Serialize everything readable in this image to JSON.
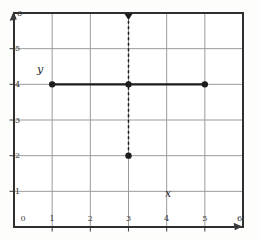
{
  "figure": {
    "background": "#fdfdfc",
    "plot_background": "#ffffff",
    "frame_color": "#2f2f2f",
    "grid_color": "#9b9b9b",
    "ink_color": "#1d1d1d",
    "tick_label_color": "#3a3a3a"
  },
  "chart_data": {
    "type": "scatter",
    "title": "",
    "xlabel": "x",
    "ylabel": "y",
    "xlim": [
      0,
      6
    ],
    "ylim": [
      0,
      6
    ],
    "grid": true,
    "x_ticks": [
      0,
      1,
      2,
      3,
      4,
      5,
      6
    ],
    "y_ticks": [
      1,
      2,
      3,
      4,
      5,
      6
    ],
    "points": [
      {
        "x": 1,
        "y": 4
      },
      {
        "x": 3,
        "y": 4
      },
      {
        "x": 5,
        "y": 4
      },
      {
        "x": 3,
        "y": 2
      }
    ],
    "segments": [
      {
        "style": "solid",
        "x1": 1,
        "y1": 4,
        "x2": 5,
        "y2": 4
      },
      {
        "style": "dashed",
        "x1": 3,
        "y1": 2,
        "x2": 3,
        "y2": 6,
        "end_marker": "triangle"
      }
    ],
    "axis_arrows": [
      "y-axis-top",
      "x-axis-right"
    ]
  }
}
